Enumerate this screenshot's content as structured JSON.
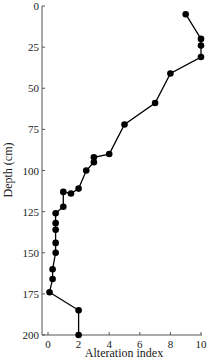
{
  "chart_data": {
    "type": "line",
    "title": "",
    "xlabel": "Alteration index",
    "ylabel": "Depth (cm)",
    "xlim": [
      0,
      10
    ],
    "ylim": [
      0,
      200
    ],
    "y_inverted": true,
    "x_ticks": [
      0,
      2,
      4,
      6,
      8,
      10
    ],
    "y_ticks": [
      0,
      25,
      50,
      75,
      100,
      125,
      150,
      175,
      200
    ],
    "grid": false,
    "legend": null,
    "series": [
      {
        "name": "Alteration index profile",
        "marker": "filled-circle",
        "color": "#000000",
        "points": [
          {
            "x": 9.0,
            "y": 5
          },
          {
            "x": 10.0,
            "y": 20
          },
          {
            "x": 10.0,
            "y": 24
          },
          {
            "x": 10.0,
            "y": 31
          },
          {
            "x": 8.0,
            "y": 41
          },
          {
            "x": 7.0,
            "y": 59
          },
          {
            "x": 5.0,
            "y": 72
          },
          {
            "x": 4.0,
            "y": 90
          },
          {
            "x": 3.0,
            "y": 92
          },
          {
            "x": 3.0,
            "y": 95
          },
          {
            "x": 2.5,
            "y": 100
          },
          {
            "x": 2.0,
            "y": 111
          },
          {
            "x": 1.5,
            "y": 114
          },
          {
            "x": 1.0,
            "y": 113
          },
          {
            "x": 1.0,
            "y": 122
          },
          {
            "x": 0.5,
            "y": 126
          },
          {
            "x": 0.5,
            "y": 132
          },
          {
            "x": 0.5,
            "y": 136
          },
          {
            "x": 0.5,
            "y": 144
          },
          {
            "x": 0.5,
            "y": 150
          },
          {
            "x": 0.3,
            "y": 160
          },
          {
            "x": 0.3,
            "y": 166
          },
          {
            "x": 0.1,
            "y": 174
          },
          {
            "x": 2.0,
            "y": 185
          },
          {
            "x": 2.0,
            "y": 200
          }
        ]
      }
    ]
  }
}
